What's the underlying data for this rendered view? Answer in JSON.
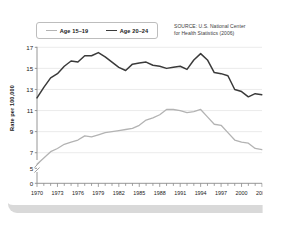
{
  "figure": {
    "source_note": [
      "SOURCE: U.S. National Center",
      "for Health Statistics (2006)"
    ],
    "source_line1": "SOURCE: U.S. National Center",
    "source_line2": "for Health Statistics (2006)"
  },
  "legend": {
    "items": [
      {
        "label": "Age 15–19",
        "color": "#b3b3b3"
      },
      {
        "label": "Age 20–24",
        "color": "#3a3a3a"
      }
    ]
  },
  "chart_data": {
    "type": "line",
    "title": "",
    "xlabel": "",
    "ylabel": "Rate per 100,000",
    "xlim": [
      1970,
      2003
    ],
    "ylim": [
      5,
      17
    ],
    "y_axis_break": true,
    "y_break_below": 5,
    "yticks": [
      0,
      5,
      7,
      9,
      11,
      13,
      15,
      17
    ],
    "ytick_labels": [
      "0",
      "5",
      "7",
      "9",
      "11",
      "13",
      "15",
      "17"
    ],
    "grid": "horizontal",
    "legend_position": "top-left",
    "x": [
      1970,
      1971,
      1972,
      1973,
      1974,
      1975,
      1976,
      1977,
      1978,
      1979,
      1980,
      1981,
      1982,
      1983,
      1984,
      1985,
      1986,
      1987,
      1988,
      1989,
      1990,
      1991,
      1992,
      1993,
      1994,
      1995,
      1996,
      1997,
      1998,
      1999,
      2000,
      2001,
      2002,
      2003
    ],
    "xtick_labels": [
      "1970",
      "1973",
      "1976",
      "1979",
      "1982",
      "1985",
      "1988",
      "1991",
      "1994",
      "1997",
      "2000",
      "2003"
    ],
    "xticks_labeled": [
      1970,
      1973,
      1976,
      1979,
      1982,
      1985,
      1988,
      1991,
      1994,
      1997,
      2000,
      2003
    ],
    "series": [
      {
        "name": "Age 15–19",
        "color": "#b3b3b3",
        "values": [
          5.9,
          6.5,
          7.1,
          7.4,
          7.8,
          8.0,
          8.2,
          8.6,
          8.5,
          8.7,
          8.9,
          9.0,
          9.1,
          9.2,
          9.3,
          9.6,
          10.1,
          10.3,
          10.6,
          11.1,
          11.1,
          11.0,
          10.8,
          10.9,
          11.1,
          10.4,
          9.7,
          9.6,
          8.9,
          8.2,
          8.0,
          7.9,
          7.4,
          7.3
        ]
      },
      {
        "name": "Age 20–24",
        "color": "#3a3a3a",
        "values": [
          12.2,
          13.2,
          14.1,
          14.5,
          15.2,
          15.7,
          15.6,
          16.2,
          16.2,
          16.5,
          16.1,
          15.6,
          15.1,
          14.8,
          15.4,
          15.5,
          15.6,
          15.3,
          15.2,
          15.0,
          15.1,
          15.2,
          14.9,
          15.8,
          16.4,
          15.8,
          14.6,
          14.5,
          14.3,
          13.0,
          12.8,
          12.3,
          12.6,
          12.5
        ]
      }
    ]
  }
}
